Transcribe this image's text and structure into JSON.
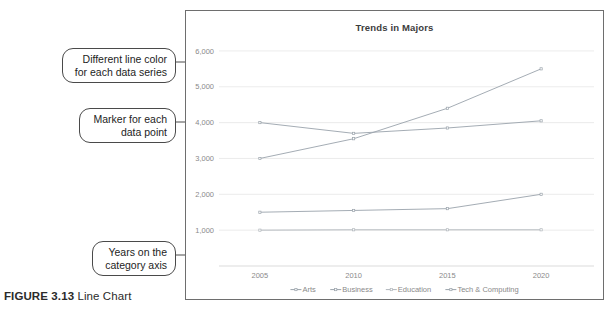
{
  "figure": {
    "label": "FIGURE 3.13",
    "title": "Line Chart"
  },
  "callouts": [
    {
      "name": "line-color",
      "line1": "Different line color",
      "line2": "for each data series"
    },
    {
      "name": "marker",
      "line1": "Marker for each",
      "line2": "data point"
    },
    {
      "name": "years",
      "line1": "Years on the",
      "line2": "category axis"
    }
  ],
  "chart_data": {
    "type": "line",
    "title": "Trends in Majors",
    "xlabel": "",
    "ylabel": "",
    "categories": [
      "2005",
      "2010",
      "2015",
      "2020"
    ],
    "yticks": [
      "1,000",
      "2,000",
      "3,000",
      "4,000",
      "5,000",
      "6,000"
    ],
    "ylim": [
      0,
      6500
    ],
    "grid": true,
    "legend_position": "bottom",
    "markers": true,
    "series": [
      {
        "name": "Arts",
        "color": "#9aa3ab",
        "values": [
          4000,
          3700,
          3850,
          4050
        ]
      },
      {
        "name": "Business",
        "color": "#9aa3ab",
        "values": [
          1500,
          1550,
          1600,
          2000
        ]
      },
      {
        "name": "Education",
        "color": "#b0b6bb",
        "values": [
          1000,
          1010,
          1010,
          1010
        ]
      },
      {
        "name": "Tech & Computing",
        "color": "#9aa3ab",
        "values": [
          3000,
          3550,
          4400,
          5500
        ]
      }
    ]
  }
}
